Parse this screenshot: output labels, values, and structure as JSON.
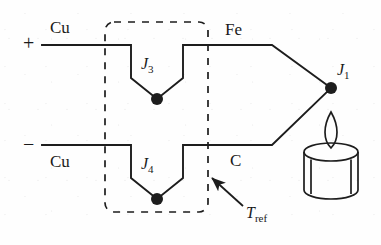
{
  "diagram": {
    "stroke_color": "#1d1d1d",
    "dash_color": "#1d1d1d",
    "background": "#fefefe",
    "terminals": {
      "positive_sign": "+",
      "negative_sign": "−"
    },
    "wire_labels": {
      "upper_copper": "Cu",
      "lower_copper": "Cu",
      "iron": "Fe",
      "constantan": "C"
    },
    "junctions": {
      "measuring": {
        "name": "J",
        "index": "1"
      },
      "reference_upper": {
        "name": "J",
        "index": "3"
      },
      "reference_lower": {
        "name": "J",
        "index": "4"
      }
    },
    "reference_block": {
      "label": "T",
      "label_sub": "ref",
      "style": "dashed rounded rectangle"
    },
    "heat_source": {
      "icon": "candle-icon",
      "description": "candle flame heating measuring junction"
    }
  }
}
